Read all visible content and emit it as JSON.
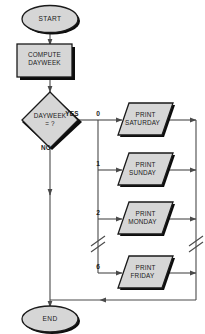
{
  "diagram": {
    "colors": {
      "shape_fill": "#d6d6d6",
      "shape_stroke": "#1a1a1a",
      "shadow": "#0d0d0d",
      "line": "#4a4a4a",
      "text": "#1a1a1a",
      "background": "#ffffff"
    },
    "nodes": {
      "start": {
        "label": "START",
        "shape": "terminator"
      },
      "compute": {
        "label": "COMPUTE\nDAYWEEK",
        "line1": "COMPUTE",
        "line2": "DAYWEEK",
        "shape": "process"
      },
      "decision": {
        "label": "DAYWEEK\n= ?",
        "line1": "DAYWEEK",
        "line2": "= ?",
        "shape": "decision"
      },
      "end": {
        "label": "END",
        "shape": "terminator"
      }
    },
    "decision_edges": {
      "yes": "YES",
      "no": "NO"
    },
    "branches": [
      {
        "number": "0",
        "line1": "PRINT",
        "line2": "SATURDAY",
        "shape": "io"
      },
      {
        "number": "1",
        "line1": "PRINT",
        "line2": "SUNDAY",
        "shape": "io"
      },
      {
        "number": "2",
        "line1": "PRINT",
        "line2": "MONDAY",
        "shape": "io"
      },
      {
        "number": "6",
        "line1": "PRINT",
        "line2": "FRIDAY",
        "shape": "io"
      }
    ],
    "break_marks": {
      "count": 2,
      "symbol": "double-slash",
      "note": "omitted branches 3-5"
    }
  }
}
